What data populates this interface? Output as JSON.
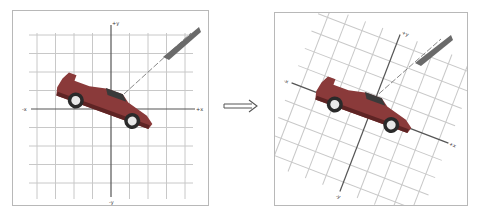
{
  "figure": {
    "left_panel": {
      "title": "original",
      "axis_labels": {
        "pos_x": "+x",
        "neg_x": "-x",
        "pos_y": "+y",
        "neg_y": "-y"
      },
      "rotation_deg": 0
    },
    "transform_arrow": {
      "icon": "double-right-arrow-icon",
      "symbol": "⟹"
    },
    "right_panel": {
      "title": "rotated",
      "axis_labels": {
        "pos_x": "+x",
        "neg_x": "-x",
        "pos_y": "+y",
        "neg_y": "-y"
      },
      "rotation_deg": 21
    },
    "colors": {
      "grid": "#c8c8c8",
      "axis": "#555555",
      "frame": "#b8b8b8",
      "car_body": "#8a3a3a",
      "car_shadow": "#5e2424",
      "wheel": "#2a2a2a",
      "rim": "#e8e8e8",
      "smoke": "#6a6a6a"
    }
  }
}
